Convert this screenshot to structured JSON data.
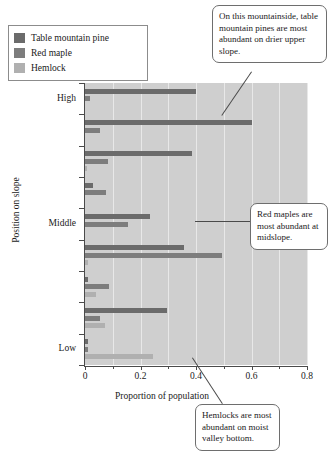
{
  "chart_data": {
    "type": "bar",
    "orientation": "horizontal",
    "title": "",
    "xlabel": "Proportion of population",
    "ylabel": "Position on slope",
    "xlim": [
      0,
      0.8
    ],
    "xticks": [
      0,
      0.2,
      0.4,
      0.6,
      0.8
    ],
    "xtick_labels": [
      "0",
      "0.2",
      "0.4",
      "0.6",
      "0.8"
    ],
    "minor_xticks": [
      0.1,
      0.3,
      0.5,
      0.7
    ],
    "grid": true,
    "grid_axis": "x",
    "legend_position": "top-left",
    "categories": [
      "High",
      "",
      "",
      "",
      "Middle",
      "",
      "",
      "",
      "Low"
    ],
    "series": [
      {
        "name": "Table mountain pine",
        "color": "#6b6b6b",
        "values": [
          0.4,
          0.6,
          0.385,
          0.028,
          0.235,
          0.355,
          0.012,
          0.295,
          0.012
        ]
      },
      {
        "name": "Red maple",
        "color": "#7d7d7d",
        "values": [
          0.018,
          0.055,
          0.082,
          0.075,
          0.155,
          0.495,
          0.088,
          0.055,
          0.012
        ]
      },
      {
        "name": "Hemlock",
        "color": "#b0b0b0",
        "values": [
          0.0,
          0.0,
          0.008,
          0.0,
          0.0,
          0.012,
          0.038,
          0.072,
          0.245
        ]
      }
    ]
  },
  "legend": {
    "items": [
      {
        "label": "Table mountain pine",
        "color": "#6b6b6b"
      },
      {
        "label": "Red maple",
        "color": "#7d7d7d"
      },
      {
        "label": "Hemlock",
        "color": "#b0b0b0"
      }
    ]
  },
  "axes": {
    "x_title": "Proportion of population",
    "y_title": "Position on slope",
    "x_labels": [
      "0",
      "0.2",
      "0.4",
      "0.6",
      "0.8"
    ],
    "y_labels": [
      "High",
      "Middle",
      "Low"
    ]
  },
  "callouts": [
    {
      "id": "co1",
      "text": "On this mountainside, table mountain pines are most abundant on drier upper slope."
    },
    {
      "id": "co2",
      "text": "Red maples are most abundant at midslope."
    },
    {
      "id": "co3",
      "text": "Hemlocks are most abundant on moist valley bottom."
    }
  ]
}
